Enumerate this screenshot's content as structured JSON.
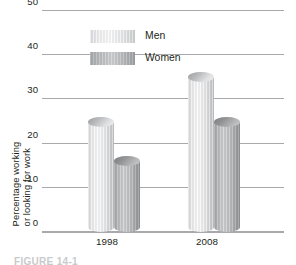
{
  "chart_data": {
    "type": "bar",
    "title": "",
    "xlabel": "",
    "ylabel": "Percentage working or looking for work",
    "ylabel_lines": [
      "Percentage working",
      "or looking for work"
    ],
    "categories": [
      "1998",
      "2008"
    ],
    "series": [
      {
        "name": "Men",
        "values": [
          25,
          35
        ],
        "color": "#ededee"
      },
      {
        "name": "Women",
        "values": [
          16,
          25
        ],
        "color": "#b6b8ba"
      }
    ],
    "ylim": [
      0,
      50
    ],
    "yticks": [
      0,
      10,
      20,
      30,
      40,
      50
    ],
    "ytick_labels": [
      "0",
      "10",
      "20",
      "30",
      "40",
      "50"
    ],
    "grid": true,
    "grid_color": "#a7a9ac",
    "legend_position": "top-center",
    "legend_entries": [
      "Men",
      "Women"
    ]
  },
  "axis": {
    "y_title_line_1": "Percentage working",
    "y_title_line_2": "or looking for work",
    "y_labels": [
      "50",
      "40",
      "30",
      "20",
      "10",
      "0"
    ],
    "x_labels": [
      "1998",
      "2008"
    ]
  },
  "legend": {
    "items": [
      {
        "label": "Men",
        "swatch": "men-swatch"
      },
      {
        "label": "Women",
        "swatch": "women-swatch"
      }
    ]
  },
  "caption": {
    "text": "FIGURE 14-1"
  }
}
